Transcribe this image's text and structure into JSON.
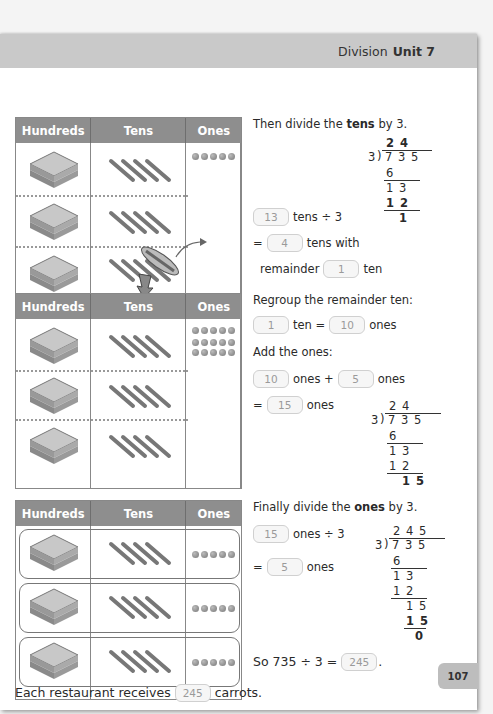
{
  "header": {
    "chapter": "Division",
    "unit": "Unit 7"
  },
  "table_headers": {
    "hundreds": "Hundreds",
    "tens": "Tens",
    "ones": "Ones"
  },
  "step1": {
    "instruction_pre": "Then divide the ",
    "instruction_bold": "tens",
    "instruction_post": " by 3.",
    "line1_answer": "13",
    "line1_text": "tens ÷ 3",
    "line2_eq": "=",
    "line2_answer": "4",
    "line2_text": "tens with",
    "line3_text": "remainder",
    "line3_answer": "1",
    "line3_unit": "ten",
    "long_division": {
      "quotient": "2 4",
      "divisor": "3",
      "dividend": "7 3 5",
      "steps": [
        "6",
        "1 3",
        "1 2",
        "1"
      ]
    }
  },
  "step2": {
    "regroup_text": "Regroup the remainder ten:",
    "regroup_a": "1",
    "regroup_a_unit": "ten =",
    "regroup_b": "10",
    "regroup_b_unit": "ones",
    "add_text": "Add the ones:",
    "add_a": "10",
    "add_a_unit": "ones +",
    "add_b": "5",
    "add_b_unit": "ones",
    "sum_eq": "=",
    "sum": "15",
    "sum_unit": "ones",
    "long_division": {
      "quotient": "2 4",
      "divisor": "3",
      "dividend": "7 3 5",
      "steps": [
        "6",
        "1 3",
        "1 2",
        "1 5"
      ]
    }
  },
  "step3": {
    "instruction_pre": "Finally divide the ",
    "instruction_bold": "ones",
    "instruction_post": " by 3.",
    "line1_answer": "15",
    "line1_text": "ones ÷ 3",
    "line2_eq": "=",
    "line2_answer": "5",
    "line2_text": "ones",
    "long_division": {
      "quotient": "2 4 5",
      "divisor": "3",
      "dividend": "7 3 5",
      "steps": [
        "6",
        "1 3",
        "1 2",
        "1 5",
        "1 5",
        "0"
      ]
    },
    "conclusion_text": "So 735 ÷ 3 =",
    "conclusion_answer": "245",
    "conclusion_end": "."
  },
  "final": {
    "text_pre": "Each restaurant receives",
    "answer": "245",
    "text_post": "carrots."
  },
  "page_number": "107"
}
